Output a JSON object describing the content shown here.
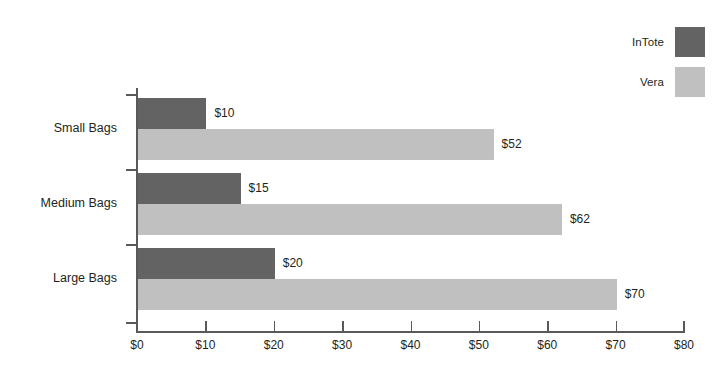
{
  "chart_data": {
    "type": "bar",
    "orientation": "horizontal",
    "title": "",
    "xlabel": "",
    "ylabel": "",
    "categories": [
      "Small Bags",
      "Medium Bags",
      "Large Bags"
    ],
    "series": [
      {
        "name": "InTote",
        "color": "#636363",
        "values": [
          10,
          15,
          20
        ],
        "value_labels": [
          "$10",
          "$15",
          "$20"
        ]
      },
      {
        "name": "Vera",
        "color": "#c0c0c0",
        "values": [
          52,
          62,
          70
        ],
        "value_labels": [
          "$52",
          "$62",
          "$70"
        ]
      }
    ],
    "xlim": [
      0,
      80
    ],
    "xticks": [
      0,
      10,
      20,
      30,
      40,
      50,
      60,
      70,
      80
    ],
    "xtick_labels": [
      "$0",
      "$10",
      "$20",
      "$30",
      "$40",
      "$50",
      "$60",
      "$70",
      "$80"
    ],
    "grid": false,
    "legend_position": "top-right",
    "axis_color": "#58595b",
    "background": "#ffffff"
  }
}
